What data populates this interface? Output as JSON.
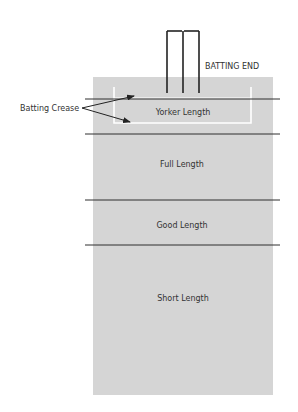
{
  "diagram": {
    "title_label": "BATTING END",
    "crease_label": "Batting Crease",
    "zones": [
      {
        "label": "Yorker Length"
      },
      {
        "label": "Full Length"
      },
      {
        "label": "Good Length"
      },
      {
        "label": "Short Length"
      }
    ],
    "colors": {
      "pitch": "#d5d5d5",
      "lines": "#2f2f2f",
      "crease_box": "#ffffff",
      "stumps": "#222222",
      "text": "#333333"
    }
  }
}
